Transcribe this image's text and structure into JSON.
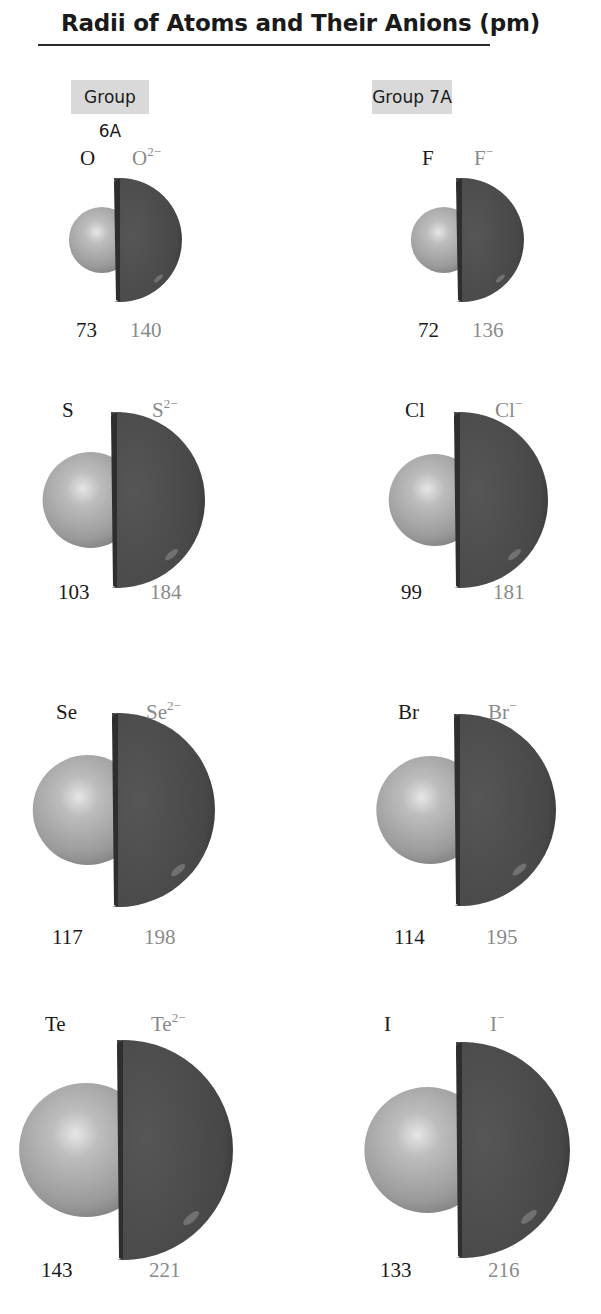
{
  "title": "Radii of Atoms and Their Anions (pm)",
  "groups": [
    {
      "label": "Group 6A",
      "rows": [
        {
          "atom": "O",
          "ion_base": "O",
          "ion_charge": "2−",
          "atom_radius": "73",
          "ion_radius": "140"
        },
        {
          "atom": "S",
          "ion_base": "S",
          "ion_charge": "2−",
          "atom_radius": "103",
          "ion_radius": "184"
        },
        {
          "atom": "Se",
          "ion_base": "Se",
          "ion_charge": "2−",
          "atom_radius": "117",
          "ion_radius": "198"
        },
        {
          "atom": "Te",
          "ion_base": "Te",
          "ion_charge": "2−",
          "atom_radius": "143",
          "ion_radius": "221"
        }
      ]
    },
    {
      "label": "Group 7A",
      "rows": [
        {
          "atom": "F",
          "ion_base": "F",
          "ion_charge": "−",
          "atom_radius": "72",
          "ion_radius": "136"
        },
        {
          "atom": "Cl",
          "ion_base": "Cl",
          "ion_charge": "−",
          "atom_radius": "99",
          "ion_radius": "181"
        },
        {
          "atom": "Br",
          "ion_base": "Br",
          "ion_charge": "−",
          "atom_radius": "114",
          "ion_radius": "195"
        },
        {
          "atom": "I",
          "ion_base": "I",
          "ion_charge": "−",
          "atom_radius": "133",
          "ion_radius": "216"
        }
      ]
    }
  ],
  "colors": {
    "atom_sphere": "#b0b0b0",
    "anion_hemisphere": "#4a4a4a",
    "group_label_bg": "#d9d9d9",
    "anion_text": "#8a8a8a"
  },
  "chart_data": {
    "type": "table",
    "title": "Radii of Atoms and Their Anions (pm)",
    "columns": [
      "Group",
      "Atom",
      "Atomic radius (pm)",
      "Anion",
      "Anion radius (pm)"
    ],
    "rows": [
      [
        "6A",
        "O",
        73,
        "O2−",
        140
      ],
      [
        "6A",
        "S",
        103,
        "S2−",
        184
      ],
      [
        "6A",
        "Se",
        117,
        "Se2−",
        198
      ],
      [
        "6A",
        "Te",
        143,
        "Te2−",
        221
      ],
      [
        "7A",
        "F",
        72,
        "F−",
        136
      ],
      [
        "7A",
        "Cl",
        99,
        "Cl−",
        181
      ],
      [
        "7A",
        "Br",
        114,
        "Br−",
        195
      ],
      [
        "7A",
        "I",
        133,
        "I−",
        216
      ]
    ]
  }
}
